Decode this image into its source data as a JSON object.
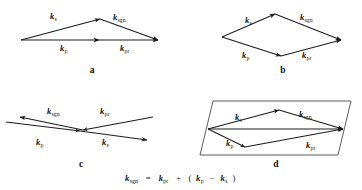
{
  "figure": {
    "background_color": "#ffffff",
    "line_color": "#1c1c1c",
    "box_color": "#4a4a4a",
    "text_color": "#111111"
  },
  "symbols": {
    "k": "k",
    "sub_s": "s",
    "sub_p": "p",
    "sub_sgn": "sgn",
    "sub_pr": "pr"
  },
  "panels": [
    {
      "id": "a",
      "letter": "a",
      "description": "Collinear-like triangle: k_p along base, k_s and k_sgn forming shallow apex",
      "labels": [
        {
          "name": "k-s",
          "base": "k",
          "sub": "s"
        },
        {
          "name": "k-sgn",
          "base": "k",
          "sub": "sgn"
        },
        {
          "name": "k-p",
          "base": "k",
          "sub": "p"
        },
        {
          "name": "k-pr",
          "base": "k",
          "sub": "pr"
        }
      ]
    },
    {
      "id": "b",
      "letter": "b",
      "description": "Rhombus / parallelogram vector addition diagram",
      "labels": [
        {
          "name": "k-s",
          "base": "k",
          "sub": "s"
        },
        {
          "name": "k-sgn",
          "base": "k",
          "sub": "sgn"
        },
        {
          "name": "k-p",
          "base": "k",
          "sub": "p"
        },
        {
          "name": "k-pr",
          "base": "k",
          "sub": "pr"
        }
      ]
    },
    {
      "id": "c",
      "letter": "c",
      "description": "Crossed (X) counter-propagating vector diagram",
      "labels": [
        {
          "name": "k-sgn",
          "base": "k",
          "sub": "sgn"
        },
        {
          "name": "k-pr",
          "base": "k",
          "sub": "pr"
        },
        {
          "name": "k-p",
          "base": "k",
          "sub": "p"
        },
        {
          "name": "k-s",
          "base": "k",
          "sub": "s"
        }
      ]
    },
    {
      "id": "d",
      "letter": "d",
      "description": "Slanted parallelogram box enclosing triangle and rhombus vector loops",
      "labels": [
        {
          "name": "k-s",
          "base": "k",
          "sub": "s"
        },
        {
          "name": "k-sgn",
          "base": "k",
          "sub": "sgn"
        },
        {
          "name": "k-p",
          "base": "k",
          "sub": "p"
        },
        {
          "name": "k-pr",
          "base": "k",
          "sub": "pr"
        }
      ]
    }
  ],
  "equation": {
    "name": "phase-matching-equation",
    "plain_text": "k_sgn = k_pr + (k_p - k_s)",
    "tokens": [
      {
        "kind": "var",
        "text": "k",
        "sub": "sgn"
      },
      {
        "kind": "op",
        "text": "="
      },
      {
        "kind": "var",
        "text": "k",
        "sub": "pr"
      },
      {
        "kind": "op",
        "text": "+"
      },
      {
        "kind": "op",
        "text": "("
      },
      {
        "kind": "var",
        "text": "k",
        "sub": "p"
      },
      {
        "kind": "op",
        "text": "−"
      },
      {
        "kind": "var",
        "text": "k",
        "sub": "s"
      },
      {
        "kind": "op",
        "text": ")"
      }
    ]
  }
}
